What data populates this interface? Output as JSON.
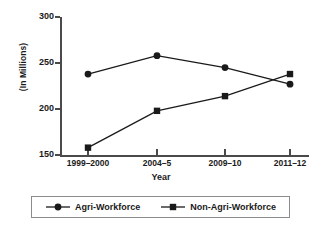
{
  "chart_data": {
    "type": "line",
    "title": "",
    "xlabel": "Year",
    "ylabel": "(In Millions)",
    "categories": [
      "1999–2000",
      "2004–5",
      "2009–10",
      "2011–12"
    ],
    "series": [
      {
        "name": "Agri-Workforce",
        "marker": "circle",
        "values": [
          238,
          258,
          245,
          227
        ]
      },
      {
        "name": "Non-Agri-Workforce",
        "marker": "square",
        "values": [
          158,
          198,
          214,
          238
        ]
      }
    ],
    "ylim": [
      150,
      300
    ],
    "yticks": [
      150,
      200,
      250,
      300
    ],
    "ytick_labels": [
      "150",
      "200",
      "250",
      "300"
    ],
    "grid": false,
    "legend_position": "bottom",
    "line_color": "#1a1a1a",
    "axis_color": "#4a4a4a"
  },
  "legend": {
    "items": [
      {
        "label": "Agri-Workforce",
        "marker": "circle-marker"
      },
      {
        "label": "Non-Agri-Workforce",
        "marker": "square-marker"
      }
    ]
  }
}
